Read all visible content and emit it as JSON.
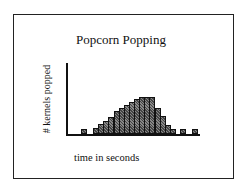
{
  "chart_data": {
    "type": "bar",
    "title": "Popcorn Popping",
    "xlabel": "time in seconds",
    "ylabel": "# kernels popped",
    "grid": false,
    "legend": null,
    "x_ticks": [],
    "y_ticks": [],
    "bar_width_px": 5,
    "baseline_px": 134,
    "bars": [
      {
        "x": 81,
        "value": 4
      },
      {
        "x": 93,
        "value": 5
      },
      {
        "x": 98,
        "value": 9
      },
      {
        "x": 103,
        "value": 12
      },
      {
        "x": 108,
        "value": 16
      },
      {
        "x": 114,
        "value": 22
      },
      {
        "x": 119,
        "value": 25
      },
      {
        "x": 124,
        "value": 28
      },
      {
        "x": 129,
        "value": 31
      },
      {
        "x": 134,
        "value": 34
      },
      {
        "x": 139,
        "value": 36
      },
      {
        "x": 144,
        "value": 36
      },
      {
        "x": 149,
        "value": 36
      },
      {
        "x": 155,
        "value": 25
      },
      {
        "x": 160,
        "value": 17
      },
      {
        "x": 165,
        "value": 8
      },
      {
        "x": 170,
        "value": 4
      },
      {
        "x": 180,
        "value": 4
      },
      {
        "x": 192,
        "value": 4
      }
    ],
    "values": [
      4,
      5,
      9,
      12,
      16,
      22,
      25,
      28,
      31,
      34,
      36,
      36,
      36,
      25,
      17,
      8,
      4,
      4,
      4
    ],
    "note": "Values are relative bar heights in pixels; no numeric axis scale is shown."
  }
}
